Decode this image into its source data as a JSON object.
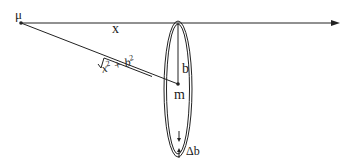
{
  "diagram": {
    "labels": {
      "mu": "μ",
      "x": "x",
      "b": "b",
      "m": "m",
      "delta_b": "Δb",
      "distance_base": "x",
      "distance_plus": " + ",
      "distance_b": "b",
      "distance_exp": "2"
    },
    "colors": {
      "stroke": "#222222",
      "background": "#ffffff"
    },
    "geometry": {
      "mu_point": [
        21,
        23
      ],
      "axis_end": [
        340,
        23
      ],
      "ring_center": [
        178,
        89
      ],
      "ring_rx": 13,
      "ring_ry": 67,
      "m_point": [
        178,
        84
      ]
    }
  }
}
